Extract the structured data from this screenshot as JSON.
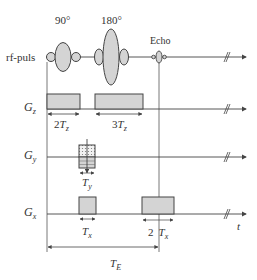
{
  "diagram": {
    "type": "spin-echo pulse sequence timing diagram",
    "rf": {
      "label": "rf-puls",
      "pulse_90_label": "90°",
      "pulse_180_label": "180°",
      "echo_label": "Echo"
    },
    "gz": {
      "label_main": "G",
      "label_sub": "z",
      "dim1_coef": "2",
      "dim1_var": "T",
      "dim1_sub": "z",
      "dim2_coef": "3",
      "dim2_var": "T",
      "dim2_sub": "z"
    },
    "gy": {
      "label_main": "G",
      "label_sub": "y",
      "dim_var": "T",
      "dim_sub": "y"
    },
    "gx": {
      "label_main": "G",
      "label_sub": "x",
      "dim1_var": "T",
      "dim1_sub": "x",
      "dim2_coef": "2",
      "dim2_var": "T",
      "dim2_sub": "x"
    },
    "time_axis_label": "t",
    "echo_time": {
      "var": "T",
      "sub": "E"
    },
    "colors": {
      "line": "#444444",
      "fill": "#d4d4d4",
      "text": "#333333"
    }
  }
}
